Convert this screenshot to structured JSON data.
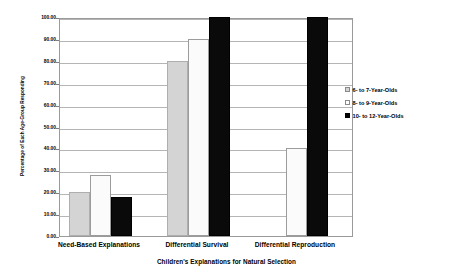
{
  "chart_data": {
    "type": "bar",
    "title": "",
    "subtitle": "",
    "xlabel": "Children's Explanations for Natural Selection",
    "ylabel": "Percentage of Each Age-Group Responding",
    "categories": [
      "Need-Based Explanations",
      "Differential Survival",
      "Differential Reproduction"
    ],
    "series": [
      {
        "name": "6- to 7-Year-Olds",
        "values": [
          20,
          80,
          0
        ],
        "color": "#d4d4d4"
      },
      {
        "name": "8- to 9-Year-Olds",
        "values": [
          28,
          90,
          40
        ],
        "color": "#fbfbfb"
      },
      {
        "name": "10- to 12-Year-Olds",
        "values": [
          18,
          100,
          100
        ],
        "color": "#0a0a0a"
      }
    ],
    "ylim": [
      0,
      100
    ],
    "yticks": [
      0,
      10,
      20,
      30,
      40,
      50,
      60,
      70,
      80,
      90,
      100
    ],
    "ytick_labels": [
      "0.00",
      "10.00",
      "20.00",
      "30.00",
      "40.00",
      "50.00",
      "60.00",
      "70.00",
      "80.00",
      "90.00",
      "100.00"
    ],
    "grid": "horizontal",
    "legend_position": "right"
  }
}
